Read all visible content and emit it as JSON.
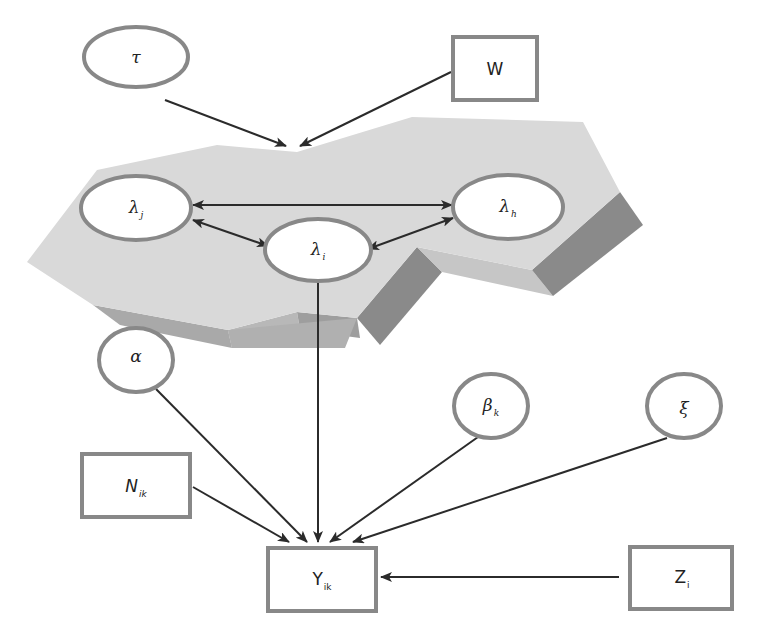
{
  "diagram": {
    "type": "graphical-model",
    "colors": {
      "node_border": "#888888",
      "node_fill": "#ffffff",
      "edge": "#2b2b2b",
      "plate_top": "#d9d9d9",
      "plate_side_light": "#c4c4c4",
      "plate_side_dark": "#8a8a8a"
    },
    "plate": {
      "label": "",
      "contains": [
        "lambda_j",
        "lambda_i",
        "lambda_h"
      ]
    },
    "nodes": {
      "tau": {
        "shape": "ellipse",
        "symbol": "τ",
        "sub": ""
      },
      "W": {
        "shape": "rect",
        "symbol": "W",
        "sub": ""
      },
      "lambda_j": {
        "shape": "ellipse",
        "symbol": "λ",
        "sub": "j"
      },
      "lambda_h": {
        "shape": "ellipse",
        "symbol": "λ",
        "sub": "h"
      },
      "lambda_i": {
        "shape": "ellipse",
        "symbol": "λ",
        "sub": "i"
      },
      "alpha": {
        "shape": "ellipse",
        "symbol": "α",
        "sub": ""
      },
      "beta_k": {
        "shape": "ellipse",
        "symbol": "β",
        "sub": "k"
      },
      "xi": {
        "shape": "ellipse",
        "symbol": "ξ",
        "sub": ""
      },
      "N_ik": {
        "shape": "rect",
        "symbol": "N",
        "sub": "ik"
      },
      "Y_ik": {
        "shape": "rect",
        "symbol": "Y",
        "sub": "ik"
      },
      "Z_i": {
        "shape": "rect",
        "symbol": "Z",
        "sub": "i"
      }
    },
    "edges": [
      {
        "from": "tau",
        "to": "plate",
        "type": "directed"
      },
      {
        "from": "W",
        "to": "plate",
        "type": "directed"
      },
      {
        "from": "lambda_j",
        "to": "lambda_h",
        "type": "bidirectional"
      },
      {
        "from": "lambda_j",
        "to": "lambda_i",
        "type": "bidirectional"
      },
      {
        "from": "lambda_i",
        "to": "lambda_h",
        "type": "bidirectional"
      },
      {
        "from": "lambda_i",
        "to": "Y_ik",
        "type": "directed"
      },
      {
        "from": "alpha",
        "to": "Y_ik",
        "type": "directed"
      },
      {
        "from": "N_ik",
        "to": "Y_ik",
        "type": "directed"
      },
      {
        "from": "beta_k",
        "to": "Y_ik",
        "type": "directed"
      },
      {
        "from": "xi",
        "to": "Y_ik",
        "type": "directed"
      },
      {
        "from": "Z_i",
        "to": "Y_ik",
        "type": "directed"
      }
    ]
  }
}
